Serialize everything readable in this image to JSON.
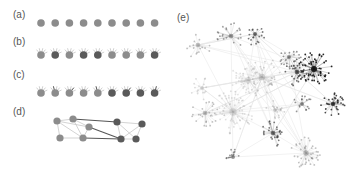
{
  "panels": {
    "a": {
      "label": "(a)",
      "shades": [
        "m",
        "m",
        "m",
        "m",
        "m",
        "m",
        "m",
        "m",
        "m"
      ]
    },
    "b": {
      "label": "(b)",
      "shades": [
        "m",
        "d",
        "m",
        "d",
        "d",
        "m",
        "m",
        "m",
        "d"
      ]
    },
    "c": {
      "label": "(c)",
      "shades": [
        "m",
        "m",
        "m",
        "m",
        "m",
        "d",
        "d",
        "d",
        "d"
      ]
    },
    "d": {
      "label": "(d)"
    },
    "e": {
      "label": "(e)"
    }
  },
  "colors": {
    "node_mid": "#8c8c8c",
    "node_dark": "#5a5a5a",
    "edge_light": "#c8c8c8",
    "edge_dark": "#555555",
    "label": "#555555"
  }
}
